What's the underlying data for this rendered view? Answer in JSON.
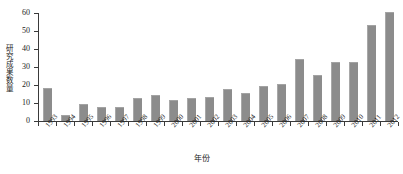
{
  "chart_data": {
    "type": "bar",
    "title": "",
    "xlabel": "年份",
    "ylabel": "研究成果数量",
    "categories": [
      "1993",
      "1994",
      "1995",
      "1996",
      "1997",
      "1998",
      "1999",
      "2000",
      "2001",
      "2002",
      "2003",
      "2004",
      "2005",
      "2006",
      "2007",
      "2008",
      "2009",
      "2010",
      "2011",
      "2012"
    ],
    "values": [
      18,
      3,
      9,
      7,
      7,
      12,
      14,
      11,
      12,
      13,
      17,
      15,
      19,
      20,
      34,
      25,
      32,
      32,
      53,
      60
    ],
    "series": [
      {
        "name": "研究成果数量",
        "values": [
          18,
          3,
          9,
          7,
          7,
          12,
          14,
          11,
          12,
          13,
          17,
          15,
          19,
          20,
          34,
          25,
          32,
          32,
          53,
          60
        ]
      }
    ],
    "ylim": [
      0,
      60
    ],
    "yticks": [
      0,
      10,
      20,
      30,
      40,
      50,
      60
    ],
    "ytick_labels": [
      "0",
      "10",
      "20",
      "30",
      "40",
      "50",
      "60"
    ],
    "grid": false,
    "legend": false,
    "legend_position": "none",
    "bar_color": "#8c8c8c",
    "axis_color": "#3a3a3a",
    "background_color": "#ffffff"
  }
}
